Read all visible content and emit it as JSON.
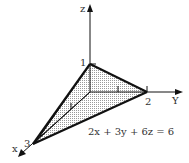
{
  "diagram": {
    "equation": "2x + 3y + 6z = 6",
    "axes": {
      "x": {
        "label": "x",
        "intercept_label": "3"
      },
      "y": {
        "label": "Y",
        "intercept_label": "2"
      },
      "z": {
        "label": "z",
        "intercept_label": "1"
      }
    },
    "tick_marks": [
      "1",
      "1"
    ],
    "colors": {
      "line": "#111111",
      "fill": "#cfcfcf",
      "text": "#333333"
    }
  }
}
